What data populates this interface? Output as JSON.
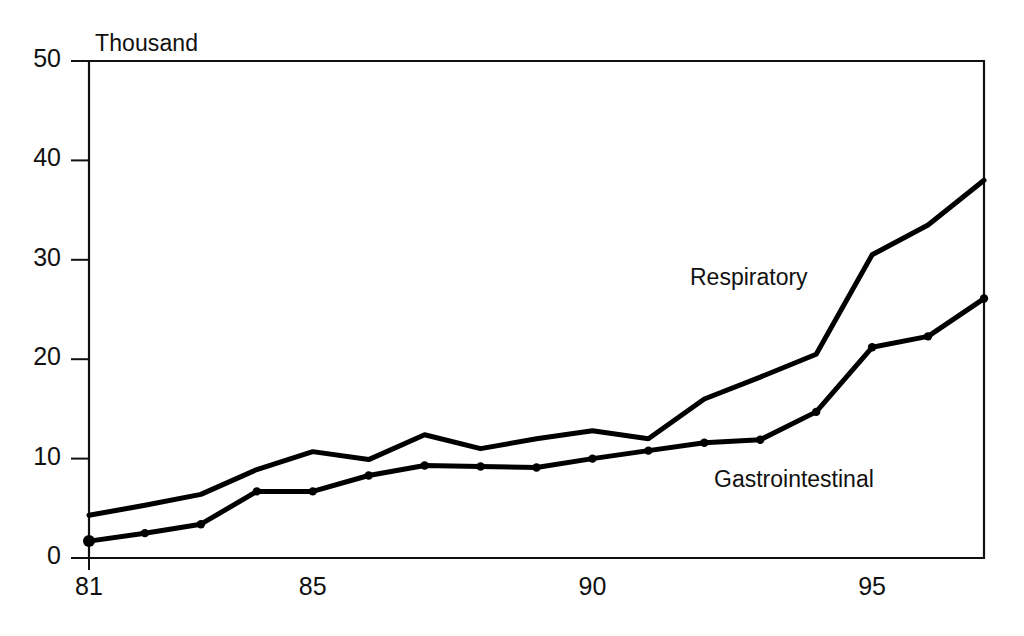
{
  "chart_data": {
    "type": "line",
    "title": "",
    "subtitle": "",
    "unit_label": "Thousand",
    "xlabel": "",
    "ylabel": "",
    "xlim": [
      81,
      97
    ],
    "ylim": [
      0,
      50
    ],
    "grid": false,
    "legend_position": "inline-annotation",
    "y_ticks": [
      0,
      10,
      20,
      30,
      40,
      50
    ],
    "y_tick_labels": [
      "0",
      "10",
      "20",
      "30",
      "40",
      "50"
    ],
    "x_ticks": [
      81,
      85,
      90,
      95
    ],
    "x_tick_labels": [
      "81",
      "85",
      "90",
      "95"
    ],
    "x": [
      81,
      82,
      83,
      84,
      85,
      86,
      87,
      88,
      89,
      90,
      91,
      92,
      93,
      94,
      95,
      96,
      97
    ],
    "series": [
      {
        "name": "Respiratory",
        "label": "Respiratory",
        "color": "#000000",
        "markers": false,
        "values": [
          4.3,
          5.3,
          6.4,
          8.9,
          10.7,
          9.9,
          12.4,
          11.0,
          12.0,
          12.8,
          12.0,
          16.0,
          18.2,
          20.5,
          30.5,
          33.5,
          38.0
        ]
      },
      {
        "name": "Gastrointestinal",
        "label": "Gastrointestinal",
        "color": "#000000",
        "markers": true,
        "values": [
          1.7,
          2.5,
          3.4,
          6.7,
          6.7,
          8.3,
          9.3,
          9.2,
          9.1,
          10.0,
          10.8,
          11.6,
          11.9,
          14.7,
          21.2,
          22.3,
          26.1
        ]
      }
    ],
    "annotations": [
      {
        "text": "Respiratory",
        "x": 94.0,
        "y": 28.5
      },
      {
        "text": "Gastrointestinal",
        "x": 94.3,
        "y": 8.6
      }
    ]
  }
}
